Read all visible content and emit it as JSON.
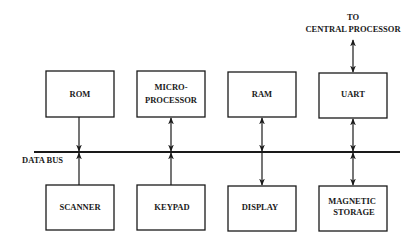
{
  "diagram": {
    "type": "block-diagram",
    "bus": {
      "label": "DATA BUS"
    },
    "external": {
      "line1": "TO",
      "line2": "CENTRAL PROCESSOR"
    },
    "top_blocks": [
      {
        "id": "rom",
        "line1": "ROM",
        "line2": "",
        "connection": "one-way-to-bus"
      },
      {
        "id": "microprocessor",
        "line1": "MICRO-",
        "line2": "PROCESSOR",
        "connection": "bidirectional"
      },
      {
        "id": "ram",
        "line1": "RAM",
        "line2": "",
        "connection": "bidirectional"
      },
      {
        "id": "uart",
        "line1": "UART",
        "line2": "",
        "connection": "bidirectional"
      }
    ],
    "bottom_blocks": [
      {
        "id": "scanner",
        "line1": "SCANNER",
        "line2": "",
        "connection": "one-way-to-bus"
      },
      {
        "id": "keypad",
        "line1": "KEYPAD",
        "line2": "",
        "connection": "one-way-to-bus"
      },
      {
        "id": "display",
        "line1": "DISPLAY",
        "line2": "",
        "connection": "one-way-from-bus"
      },
      {
        "id": "magnetic-storage",
        "line1": "MAGNETIC",
        "line2": "STORAGE",
        "connection": "bidirectional"
      }
    ],
    "colors": {
      "ink": "#1a1a1a",
      "background": "#ffffff"
    }
  }
}
